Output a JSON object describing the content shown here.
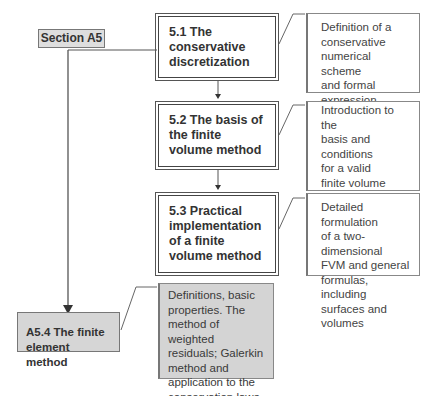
{
  "section_label": "Section A5",
  "nodes": [
    {
      "id": "5.1",
      "title": "5.1  The conservative discretization",
      "description": "Definition of a\nconservative\nnumerical scheme\nand formal expression"
    },
    {
      "id": "5.2",
      "title": "5.2  The basis of the finite volume method",
      "description": "Introduction to the\nbasis and conditions\nfor a valid\nfinite volume method.\nGeneral form of a\nnumerical scheme"
    },
    {
      "id": "5.3",
      "title": "5.3  Practical implementation of a finite volume method",
      "description": "Detailed formulation\nof a two-dimensional\nFVM and general\nformulas, including\nsurfaces and volumes"
    },
    {
      "id": "A5.4",
      "title": "A5.4  The finite element method",
      "description": "Definitions, basic\nproperties. The\nmethod of weighted\nresiduals; Galerkin\nmethod and\napplication to the\nconservation laws"
    }
  ],
  "colors": {
    "line": "#555555",
    "grey_fill": "#d4d4d4",
    "label_fill": "#dedede"
  }
}
